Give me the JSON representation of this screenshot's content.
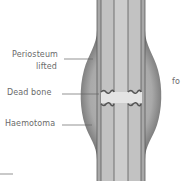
{
  "diagram": {
    "labels": {
      "periosteum_line1": "Periosteum",
      "periosteum_line2": "lifted",
      "dead_bone": "Dead bone",
      "haemotoma": "Haemotoma",
      "cutoff_text": "fo"
    },
    "colors": {
      "bone_light": "#c6c6c6",
      "bone_mid": "#b4b4b4",
      "swelling_dark": "#6e6e6e",
      "swelling_light": "#bdbdbd",
      "line": "#555555",
      "label_text": "#6a6a6a"
    }
  }
}
